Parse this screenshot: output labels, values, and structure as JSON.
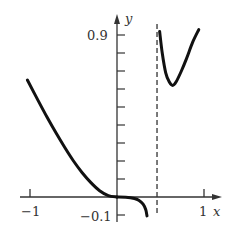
{
  "chart_data": {
    "type": "line",
    "title": "",
    "xlabel": "x",
    "ylabel": "y",
    "xlim": [
      -1.1,
      1.2
    ],
    "ylim": [
      -0.12,
      0.95
    ],
    "grid": false,
    "legend": null,
    "x_ticks": [
      -1,
      1
    ],
    "x_tick_labels": [
      "-1",
      "1"
    ],
    "y_ticks": [
      -0.1,
      0.1,
      0.2,
      0.3,
      0.4,
      0.5,
      0.6,
      0.7,
      0.8,
      0.9
    ],
    "y_tick_labels_shown": {
      "0.9": "0.9",
      "-0.1": "−0.1"
    },
    "vertical_asymptote": {
      "x": 0.46,
      "style": "dashed"
    },
    "series": [
      {
        "name": "left-branch",
        "x": [
          -1.03,
          -0.9,
          -0.8,
          -0.7,
          -0.6,
          -0.5,
          -0.4,
          -0.3,
          -0.2,
          -0.1,
          0.0
        ],
        "y": [
          0.65,
          0.53,
          0.44,
          0.355,
          0.275,
          0.2,
          0.135,
          0.08,
          0.035,
          0.008,
          0.0
        ]
      },
      {
        "name": "middle-branch",
        "x": [
          0.0,
          0.1,
          0.2,
          0.25,
          0.3,
          0.33,
          0.345
        ],
        "y": [
          0.0,
          -0.001,
          -0.008,
          -0.018,
          -0.04,
          -0.07,
          -0.105
        ]
      },
      {
        "name": "right-branch",
        "x": [
          0.49,
          0.52,
          0.56,
          0.6,
          0.64,
          0.68,
          0.74,
          0.8,
          0.87,
          0.94
        ],
        "y": [
          0.92,
          0.8,
          0.69,
          0.64,
          0.62,
          0.64,
          0.7,
          0.77,
          0.86,
          0.93
        ]
      }
    ]
  },
  "labels": {
    "x_axis": "x",
    "y_axis": "y",
    "x_tick_neg1": "−1",
    "x_tick_1": "1",
    "y_tick_09": "0.9",
    "y_tick_neg01": "−0.1"
  }
}
